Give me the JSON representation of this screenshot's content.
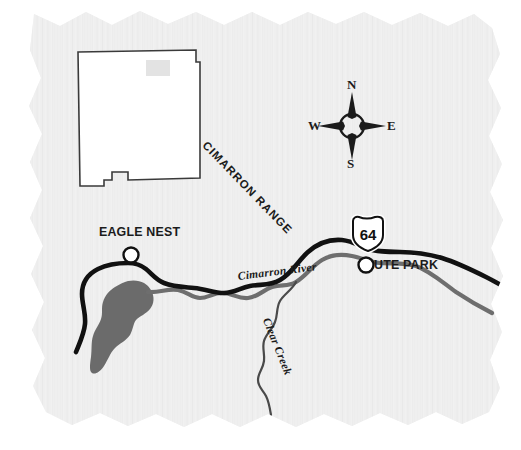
{
  "map": {
    "title": "Eagle Nest / Ute Park area map, northern New Mexico",
    "background_color": "#ebebeb",
    "paper_style": "torn-deckled-edge paper with subtle fiber texture",
    "inset": {
      "name": "new-mexico-state-outline",
      "fill_color": "#ffffff",
      "stroke_color": "#3a3a3a",
      "area_marker_color": "#e2e2e2",
      "area_marker_label": ""
    },
    "compass": {
      "north_label": "N",
      "south_label": "S",
      "east_label": "E",
      "west_label": "W",
      "color": "#1b1b1b"
    },
    "places": [
      {
        "id": "eagle-nest",
        "label": "EAGLE NEST",
        "marker": "open-circle"
      },
      {
        "id": "ute-park",
        "label": "UTE PARK",
        "marker": "open-circle"
      }
    ],
    "highways": [
      {
        "id": "us-64",
        "shield_type": "us-route",
        "number": "64",
        "color": "#111111"
      }
    ],
    "water_features": [
      {
        "id": "cimarron-river",
        "label": "Cimarron River",
        "color": "#6e6e6e",
        "type": "river"
      },
      {
        "id": "clear-creek",
        "label": "Clear Creek",
        "color": "#4a4a4a",
        "type": "creek"
      },
      {
        "id": "eagle-nest-lake",
        "label": "",
        "color": "#6b6b6b",
        "type": "lake"
      }
    ],
    "terrain": [
      {
        "id": "cimarron-range",
        "label": "CIMARRON RANGE",
        "type": "mountain-range"
      }
    ]
  }
}
